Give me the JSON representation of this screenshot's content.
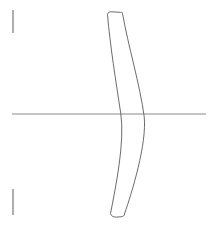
{
  "figure": {
    "background_color": "#ffffff",
    "width": 212,
    "height": 225
  },
  "style": {
    "outline_color": "#5a5a5a",
    "outline_width": 0.9,
    "axis_color": "#8a8a8a",
    "axis_width": 1.0,
    "tick_color": "#9a9a9a",
    "tick_width": 1.6
  },
  "chart_data": {
    "type": "line",
    "xlabel": "",
    "ylabel": "",
    "grid": false,
    "legend": null,
    "xlim": [
      0,
      212
    ],
    "ylim": [
      0,
      225
    ],
    "annotations": [],
    "series": [
      {
        "name": "optical-axis",
        "kind": "axis",
        "x": [
          12,
          206
        ],
        "y": [
          114,
          114
        ]
      },
      {
        "name": "aperture-tick-top",
        "kind": "tick",
        "x": [
          13,
          13
        ],
        "y": [
          10,
          33
        ]
      },
      {
        "name": "aperture-tick-bottom",
        "kind": "tick",
        "x": [
          13,
          13
        ],
        "y": [
          189,
          215
        ]
      },
      {
        "name": "lens-front-surface",
        "kind": "curve",
        "description": "left (concave) surface of the meniscus element",
        "path": "M 107.5 14.5 C 110.0 45.0 116.0 82.0 120.8 113.8 C 125.0 142.0 115.5 188.0 110.5 213.5",
        "vertex_on_axis": [
          120.8,
          114
        ]
      },
      {
        "name": "lens-rear-surface",
        "kind": "curve",
        "description": "right (convex) surface of the meniscus element",
        "path": "M 122.5 13.5 C 128.0 45.0 140.0 85.0 144.2 116.5 C 147.0 144.0 132.0 192.0 124.5 214.0",
        "vertex_on_axis": [
          143.5,
          114
        ]
      },
      {
        "name": "lens-top-edge",
        "kind": "edge",
        "path": "M 107.5 14.5 C 107.8 12.4 109.4 11.6 111.6 11.8 L 120.4 12.3 C 122.3 12.5 123.0 12.7 122.5 13.5"
      },
      {
        "name": "lens-bottom-edge",
        "kind": "edge",
        "path": "M 110.5 213.5 C 111.2 216.2 113.6 217.2 116.6 217.1 L 120.8 216.8 C 123.4 216.5 124.6 215.6 124.5 214.0"
      }
    ]
  },
  "elements": {
    "lens_label": "lens element",
    "axis_label": "optical axis",
    "tick_top_label": "aperture mark top",
    "tick_bottom_label": "aperture mark bottom"
  }
}
